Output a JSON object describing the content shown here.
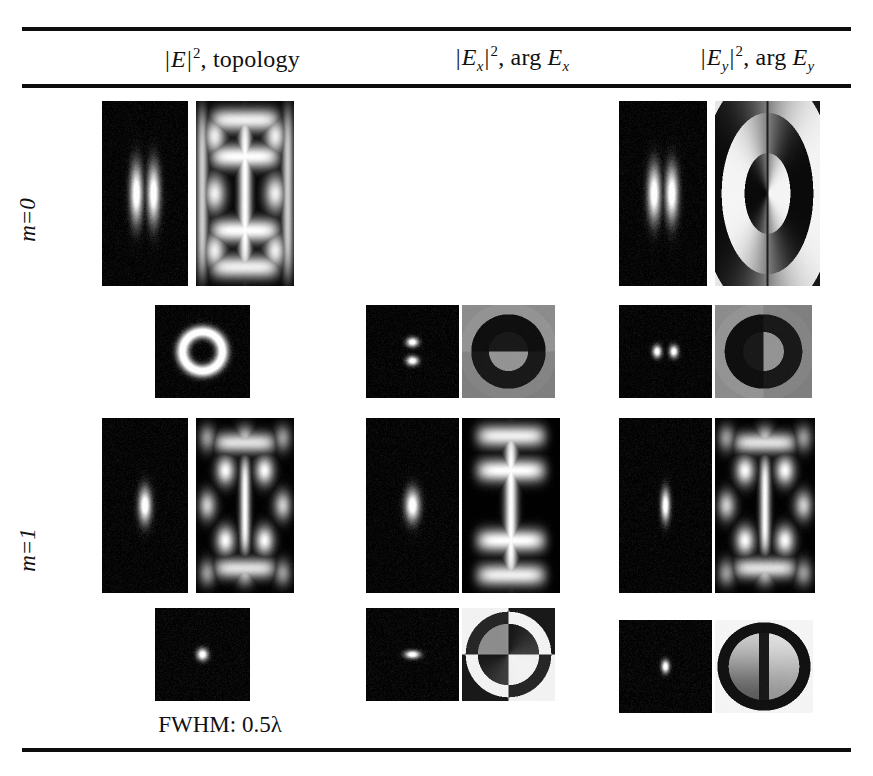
{
  "figure": {
    "kind": "results-table",
    "caption": "FWHM: 0.5λ",
    "rules": [
      "top",
      "under-header",
      "bottom"
    ]
  },
  "columns": [
    {
      "id": "col-total",
      "label_plain": "|E|², topology",
      "quantity": "|E|",
      "exponent": "2",
      "separator": ", ",
      "second": "topology"
    },
    {
      "id": "col-ex",
      "label_plain": "|Ex|², arg Ex",
      "quantity": "|E",
      "quantity_sub": "x",
      "exponent": "2",
      "separator": ", ",
      "second": "arg E",
      "second_sub": "x"
    },
    {
      "id": "col-ey",
      "label_plain": "|Ey|², arg Ey",
      "quantity": "|E",
      "quantity_sub": "y",
      "exponent": "2",
      "separator": ", ",
      "second": "arg E",
      "second_sub": "y"
    }
  ],
  "row_groups": [
    {
      "id": "group-m0",
      "label": "m=0",
      "label_var": "m",
      "label_rest": "=0"
    },
    {
      "id": "group-m1",
      "label": "m=1",
      "label_var": "m",
      "label_rest": "=1"
    }
  ],
  "panels": [
    {
      "id": "r1c1-intensity",
      "name": "intensity-m0-total-longitudinal",
      "row": 1,
      "col": 1,
      "kind": "intensity",
      "x": 102,
      "y": 101,
      "w": 86,
      "h": 185,
      "pattern": "two-vertical-lobes",
      "lobes": [
        {
          "cx": 0.4,
          "cy": 0.5,
          "rx": 0.085,
          "ry": 0.18
        },
        {
          "cx": 0.6,
          "cy": 0.5,
          "rx": 0.085,
          "ry": 0.18
        }
      ],
      "noise": 0.1
    },
    {
      "id": "r1c1-topology",
      "name": "topology-m0-total-longitudinal",
      "row": 1,
      "col": 1,
      "kind": "topology",
      "x": 196,
      "y": 101,
      "w": 98,
      "h": 185,
      "pattern": "ibeam-lattice",
      "noise": 0.04
    },
    {
      "id": "r1c3-intensity",
      "name": "intensity-m0-ey-longitudinal",
      "row": 1,
      "col": 3,
      "kind": "intensity",
      "x": 619,
      "y": 101,
      "w": 88,
      "h": 185,
      "pattern": "two-vertical-lobes",
      "lobes": [
        {
          "cx": 0.4,
          "cy": 0.5,
          "rx": 0.085,
          "ry": 0.17
        },
        {
          "cx": 0.6,
          "cy": 0.5,
          "rx": 0.085,
          "ry": 0.17
        }
      ],
      "noise": 0.1
    },
    {
      "id": "r1c3-phase",
      "name": "phase-m0-ey-longitudinal",
      "row": 1,
      "col": 3,
      "kind": "phase",
      "x": 715,
      "y": 101,
      "w": 105,
      "h": 185,
      "pattern": "concentric-rings-split",
      "noise": 0.02
    },
    {
      "id": "r2c1-intensity",
      "name": "intensity-m1-total-transverse",
      "row": 2,
      "col": 1,
      "kind": "intensity",
      "x": 155,
      "y": 305,
      "w": 95,
      "h": 93,
      "pattern": "donut",
      "ring_r": 0.21,
      "ring_w": 0.085,
      "noise": 0.1
    },
    {
      "id": "r2c2-intensity",
      "name": "intensity-m1-ex-transverse",
      "row": 2,
      "col": 2,
      "kind": "intensity",
      "x": 366,
      "y": 305,
      "w": 93,
      "h": 93,
      "pattern": "two-stacked-lobes",
      "lobes": [
        {
          "cx": 0.5,
          "cy": 0.4,
          "rx": 0.075,
          "ry": 0.058
        },
        {
          "cx": 0.5,
          "cy": 0.6,
          "rx": 0.075,
          "ry": 0.058
        }
      ],
      "noise": 0.1
    },
    {
      "id": "r2c2-phase",
      "name": "phase-m1-ex-transverse",
      "row": 2,
      "col": 2,
      "kind": "phase",
      "x": 462,
      "y": 305,
      "w": 93,
      "h": 93,
      "pattern": "ring-half-split-horizontal",
      "noise": 0.03
    },
    {
      "id": "r2c3-intensity",
      "name": "intensity-m1-ey-transverse",
      "row": 2,
      "col": 3,
      "kind": "intensity",
      "x": 619,
      "y": 305,
      "w": 93,
      "h": 93,
      "pattern": "two-horizontal-lobes",
      "lobes": [
        {
          "cx": 0.41,
          "cy": 0.5,
          "rx": 0.055,
          "ry": 0.075
        },
        {
          "cx": 0.59,
          "cy": 0.5,
          "rx": 0.055,
          "ry": 0.075
        }
      ],
      "noise": 0.1
    },
    {
      "id": "r2c3-phase",
      "name": "phase-m1-ey-transverse",
      "row": 2,
      "col": 3,
      "kind": "phase",
      "x": 715,
      "y": 305,
      "w": 97,
      "h": 93,
      "pattern": "ring-half-split-vertical",
      "noise": 0.03
    },
    {
      "id": "r3c1-intensity",
      "name": "intensity-m1-total-longitudinal",
      "row": 3,
      "col": 1,
      "kind": "intensity",
      "x": 102,
      "y": 418,
      "w": 86,
      "h": 175,
      "pattern": "single-vertical-lobe",
      "lobes": [
        {
          "cx": 0.5,
          "cy": 0.5,
          "rx": 0.085,
          "ry": 0.115
        }
      ],
      "noise": 0.1
    },
    {
      "id": "r3c1-topology",
      "name": "topology-m1-total-longitudinal",
      "row": 3,
      "col": 1,
      "kind": "topology",
      "x": 196,
      "y": 418,
      "w": 98,
      "h": 175,
      "pattern": "ibeam-checker",
      "noise": 0.05
    },
    {
      "id": "r3c2-intensity",
      "name": "intensity-m1-ex-longitudinal",
      "row": 3,
      "col": 2,
      "kind": "intensity",
      "x": 366,
      "y": 418,
      "w": 93,
      "h": 175,
      "pattern": "single-vertical-lobe",
      "lobes": [
        {
          "cx": 0.5,
          "cy": 0.5,
          "rx": 0.09,
          "ry": 0.105
        }
      ],
      "noise": 0.1
    },
    {
      "id": "r3c2-topology",
      "name": "topology-m1-ex-longitudinal",
      "row": 3,
      "col": 2,
      "kind": "topology",
      "x": 462,
      "y": 418,
      "w": 98,
      "h": 175,
      "pattern": "ibeam-column",
      "noise": 0.04
    },
    {
      "id": "r3c3-intensity",
      "name": "intensity-m1-ey-longitudinal",
      "row": 3,
      "col": 3,
      "kind": "intensity",
      "x": 619,
      "y": 418,
      "w": 93,
      "h": 175,
      "pattern": "single-vertical-lobe",
      "lobes": [
        {
          "cx": 0.5,
          "cy": 0.5,
          "rx": 0.055,
          "ry": 0.105
        }
      ],
      "noise": 0.1
    },
    {
      "id": "r3c3-topology",
      "name": "topology-m1-ey-longitudinal",
      "row": 3,
      "col": 3,
      "kind": "topology",
      "x": 715,
      "y": 418,
      "w": 100,
      "h": 175,
      "pattern": "ibeam-checker",
      "noise": 0.05
    },
    {
      "id": "r4c1-intensity",
      "name": "intensity-m1-total-focal",
      "row": 4,
      "col": 1,
      "kind": "intensity",
      "x": 155,
      "y": 608,
      "w": 95,
      "h": 93,
      "pattern": "single-spot",
      "lobes": [
        {
          "cx": 0.5,
          "cy": 0.5,
          "rx": 0.068,
          "ry": 0.075
        }
      ],
      "noise": 0.11
    },
    {
      "id": "r4c2-intensity",
      "name": "intensity-m1-ex-focal",
      "row": 4,
      "col": 2,
      "kind": "intensity",
      "x": 366,
      "y": 608,
      "w": 93,
      "h": 93,
      "pattern": "single-horizontal-lobe",
      "lobes": [
        {
          "cx": 0.5,
          "cy": 0.5,
          "rx": 0.095,
          "ry": 0.05
        }
      ],
      "noise": 0.11
    },
    {
      "id": "r4c2-phase",
      "name": "phase-m1-ex-focal",
      "row": 4,
      "col": 2,
      "kind": "phase",
      "x": 462,
      "y": 608,
      "w": 93,
      "h": 93,
      "pattern": "quadrant-checker-disc",
      "noise": 0.03
    },
    {
      "id": "r4c3-intensity",
      "name": "intensity-m1-ey-focal",
      "row": 4,
      "col": 3,
      "kind": "intensity",
      "x": 619,
      "y": 620,
      "w": 93,
      "h": 93,
      "pattern": "single-vertical-lobe-small",
      "lobes": [
        {
          "cx": 0.5,
          "cy": 0.5,
          "rx": 0.05,
          "ry": 0.08
        }
      ],
      "noise": 0.11
    },
    {
      "id": "r4c3-phase",
      "name": "phase-m1-ey-focal",
      "row": 4,
      "col": 3,
      "kind": "phase",
      "x": 715,
      "y": 620,
      "w": 98,
      "h": 93,
      "pattern": "lens-disc-split",
      "noise": 0.03
    }
  ],
  "colors": {
    "rule": "#0d0d0d",
    "text": "#111111",
    "panel_dark": "#0a0a0a",
    "panel_light": "#f2f2f2",
    "panel_mid": "#8a8a8a",
    "background": "#ffffff"
  }
}
